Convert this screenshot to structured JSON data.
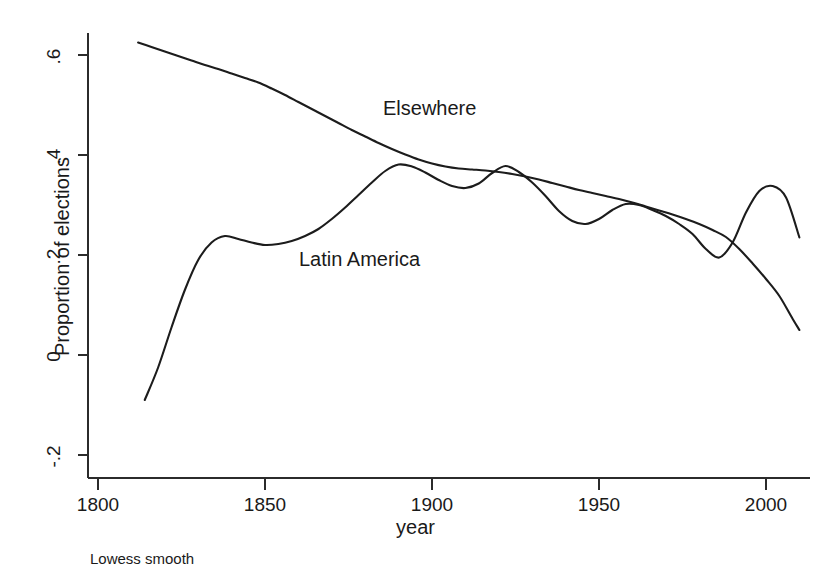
{
  "chart_data": {
    "type": "line",
    "title": "",
    "subtitle": "",
    "xlabel": "year",
    "ylabel": "Proportion of elections",
    "footnote": "Lowess smooth",
    "xlim": [
      1796,
      2014
    ],
    "ylim": [
      -0.24,
      0.64
    ],
    "xticks": [
      1800,
      1850,
      1900,
      1950,
      2000
    ],
    "xtick_labels": [
      "1800",
      "1850",
      "1900",
      "1950",
      "2000"
    ],
    "yticks": [
      -0.2,
      0,
      0.2,
      0.4,
      0.6
    ],
    "ytick_labels": [
      "-.2",
      "0",
      ".2",
      ".4",
      ".6"
    ],
    "grid": false,
    "legend_position": "inline-annotation",
    "line_color": "#1c1c1c",
    "series": [
      {
        "name": "Elsewhere",
        "annotation_label": "Elsewhere",
        "x": [
          1812,
          1816,
          1820,
          1824,
          1828,
          1832,
          1836,
          1840,
          1844,
          1848,
          1852,
          1856,
          1860,
          1864,
          1868,
          1872,
          1876,
          1880,
          1884,
          1888,
          1892,
          1896,
          1900,
          1904,
          1908,
          1912,
          1916,
          1920,
          1924,
          1928,
          1932,
          1936,
          1940,
          1944,
          1948,
          1952,
          1956,
          1960,
          1964,
          1968,
          1972,
          1976,
          1980,
          1984,
          1988,
          1992,
          1996,
          2000,
          2004,
          2008,
          2010
        ],
        "values": [
          0.625,
          0.616,
          0.607,
          0.598,
          0.589,
          0.58,
          0.572,
          0.563,
          0.554,
          0.545,
          0.533,
          0.52,
          0.506,
          0.492,
          0.478,
          0.464,
          0.45,
          0.437,
          0.424,
          0.412,
          0.401,
          0.391,
          0.383,
          0.377,
          0.373,
          0.371,
          0.369,
          0.366,
          0.362,
          0.357,
          0.351,
          0.344,
          0.337,
          0.33,
          0.324,
          0.318,
          0.312,
          0.305,
          0.297,
          0.289,
          0.281,
          0.272,
          0.262,
          0.25,
          0.236,
          0.212,
          0.183,
          0.152,
          0.118,
          0.072,
          0.05
        ]
      },
      {
        "name": "Latin America",
        "annotation_label": "Latin America",
        "x": [
          1814,
          1818,
          1822,
          1826,
          1830,
          1834,
          1838,
          1842,
          1846,
          1850,
          1854,
          1858,
          1862,
          1866,
          1870,
          1874,
          1878,
          1882,
          1886,
          1890,
          1894,
          1898,
          1902,
          1906,
          1910,
          1914,
          1918,
          1922,
          1926,
          1930,
          1934,
          1938,
          1942,
          1946,
          1950,
          1954,
          1958,
          1962,
          1966,
          1970,
          1974,
          1978,
          1982,
          1986,
          1990,
          1994,
          1998,
          2002,
          2006,
          2010
        ],
        "values": [
          -0.09,
          -0.025,
          0.055,
          0.13,
          0.19,
          0.225,
          0.238,
          0.232,
          0.225,
          0.22,
          0.222,
          0.228,
          0.238,
          0.252,
          0.272,
          0.295,
          0.32,
          0.345,
          0.368,
          0.381,
          0.377,
          0.365,
          0.35,
          0.338,
          0.334,
          0.343,
          0.364,
          0.378,
          0.366,
          0.345,
          0.318,
          0.288,
          0.268,
          0.262,
          0.272,
          0.29,
          0.302,
          0.3,
          0.29,
          0.278,
          0.262,
          0.242,
          0.212,
          0.195,
          0.225,
          0.285,
          0.328,
          0.338,
          0.315,
          0.235
        ]
      }
    ]
  },
  "axes": {
    "y_axis_title": "Proportion of elections",
    "x_axis_title": "year",
    "caption": "Lowess smooth"
  }
}
